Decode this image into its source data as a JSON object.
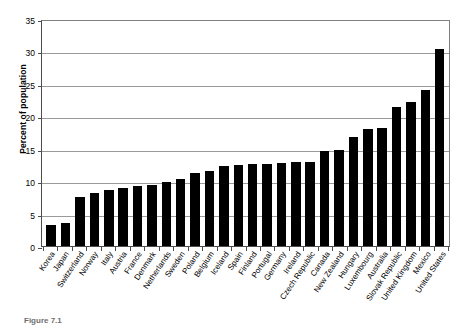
{
  "chart_data": {
    "type": "bar",
    "title": "",
    "xlabel": "",
    "ylabel": "Percent of population",
    "ylim": [
      0,
      35
    ],
    "yticks": [
      0,
      5,
      10,
      15,
      20,
      25,
      30,
      35
    ],
    "grid": true,
    "legend": "none",
    "bar_color": "#000000",
    "categories": [
      "Korea",
      "Japan",
      "Switzerland",
      "Norway",
      "Italy",
      "Austria",
      "France",
      "Denmark",
      "Netherlands",
      "Sweden",
      "Poland",
      "Belgium",
      "Iceland",
      "Spain",
      "Finland",
      "Portugal",
      "Germany",
      "Ireland",
      "Czech Republic",
      "Canada",
      "New Zealand",
      "Hungary",
      "Luxembourg",
      "Australia",
      "Slovak Republic",
      "United Kingdom",
      "Mexico",
      "United States"
    ],
    "values": [
      3.2,
      3.6,
      7.6,
      8.2,
      8.6,
      9.0,
      9.3,
      9.4,
      9.9,
      10.3,
      11.3,
      11.6,
      12.3,
      12.5,
      12.7,
      12.7,
      12.8,
      12.9,
      13.0,
      14.6,
      14.8,
      16.8,
      18.0,
      18.2,
      21.5,
      22.2,
      24.0,
      30.4
    ]
  },
  "caption": {
    "text": "Figure 7.1"
  }
}
